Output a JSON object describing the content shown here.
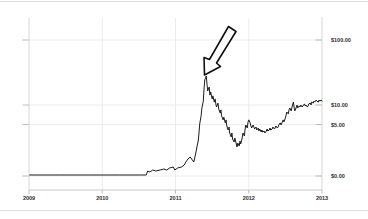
{
  "page": {
    "background": "#ffffff",
    "top_rule_color": "#dedede",
    "bottom_rule_color": "#dedede"
  },
  "chart_data": {
    "type": "line",
    "title": "",
    "xlabel": "",
    "ylabel": "",
    "x_range": [
      2009,
      2013
    ],
    "grid": true,
    "legend": "none",
    "x_ticks": [
      {
        "label": "2009",
        "value": 2009
      },
      {
        "label": "2010",
        "value": 2010
      },
      {
        "label": "2011",
        "value": 2011
      },
      {
        "label": "2012",
        "value": 2012
      },
      {
        "label": "2013",
        "value": 2013
      }
    ],
    "y_ticks": [
      {
        "label": "$100.00",
        "value": 100
      },
      {
        "label": "$10.00",
        "value": 10
      },
      {
        "label": "$5.00",
        "value": 5
      },
      {
        "label": "$0.00",
        "value": 0
      }
    ],
    "colors": {
      "line": "#1c1c1c",
      "grid": "#ececec",
      "axis": "#d6d6d6",
      "axis_bottom": "#c9c9c9",
      "tick": "#bdbdbd",
      "label": "#2b2b2b",
      "annotation_fill": "#ffffff",
      "annotation_stroke": "#111111"
    },
    "series": [
      {
        "name": "price-usd",
        "points": [
          [
            2009.01,
            0.1
          ],
          [
            2009.42,
            0.1
          ],
          [
            2009.83,
            0.1
          ],
          [
            2010.24,
            0.1
          ],
          [
            2010.52,
            0.1
          ],
          [
            2010.6,
            0.1
          ],
          [
            2010.62,
            0.49
          ],
          [
            2010.65,
            0.39
          ],
          [
            2010.69,
            0.58
          ],
          [
            2010.73,
            0.49
          ],
          [
            2010.79,
            0.58
          ],
          [
            2010.84,
            0.68
          ],
          [
            2010.88,
            0.58
          ],
          [
            2010.92,
            0.78
          ],
          [
            2010.97,
            0.87
          ],
          [
            2010.99,
            0.58
          ],
          [
            2011.03,
            0.78
          ],
          [
            2011.08,
            0.87
          ],
          [
            2011.12,
            1.07
          ],
          [
            2011.14,
            1.36
          ],
          [
            2011.17,
            1.65
          ],
          [
            2011.2,
            1.84
          ],
          [
            2011.23,
            1.55
          ],
          [
            2011.25,
            1.36
          ],
          [
            2011.28,
            2.33
          ],
          [
            2011.29,
            2.72
          ],
          [
            2011.31,
            3.4
          ],
          [
            2011.32,
            4.08
          ],
          [
            2011.33,
            5.1
          ],
          [
            2011.35,
            6.8
          ],
          [
            2011.36,
            9.0
          ],
          [
            2011.38,
            11.5
          ],
          [
            2011.39,
            18.3
          ],
          [
            2011.4,
            24.3
          ],
          [
            2011.42,
            27.9
          ],
          [
            2011.43,
            21.0
          ],
          [
            2011.44,
            16.4
          ],
          [
            2011.46,
            18.9
          ],
          [
            2011.47,
            14.2
          ],
          [
            2011.48,
            15.9
          ],
          [
            2011.5,
            12.4
          ],
          [
            2011.51,
            13.8
          ],
          [
            2011.53,
            11.1
          ],
          [
            2011.54,
            12.4
          ],
          [
            2011.55,
            10.4
          ],
          [
            2011.56,
            9.3
          ],
          [
            2011.58,
            10.7
          ],
          [
            2011.59,
            8.7
          ],
          [
            2011.61,
            7.5
          ],
          [
            2011.62,
            8.4
          ],
          [
            2011.63,
            6.8
          ],
          [
            2011.65,
            5.9
          ],
          [
            2011.66,
            6.5
          ],
          [
            2011.68,
            5.3
          ],
          [
            2011.69,
            5.9
          ],
          [
            2011.7,
            4.85
          ],
          [
            2011.72,
            4.47
          ],
          [
            2011.73,
            4.76
          ],
          [
            2011.74,
            4.17
          ],
          [
            2011.76,
            3.79
          ],
          [
            2011.77,
            4.17
          ],
          [
            2011.78,
            3.59
          ],
          [
            2011.8,
            3.3
          ],
          [
            2011.81,
            3.69
          ],
          [
            2011.83,
            3.11
          ],
          [
            2011.84,
            2.82
          ],
          [
            2011.85,
            3.2
          ],
          [
            2011.87,
            2.91
          ],
          [
            2011.88,
            3.4
          ],
          [
            2011.89,
            3.11
          ],
          [
            2011.91,
            3.69
          ],
          [
            2011.92,
            4.17
          ],
          [
            2011.94,
            3.88
          ],
          [
            2011.95,
            4.56
          ],
          [
            2011.96,
            4.95
          ],
          [
            2011.98,
            4.66
          ],
          [
            2011.99,
            5.47
          ],
          [
            2012.0,
            5.9
          ],
          [
            2012.02,
            5.3
          ],
          [
            2012.03,
            4.85
          ],
          [
            2012.04,
            4.66
          ],
          [
            2012.06,
            4.95
          ],
          [
            2012.07,
            4.76
          ],
          [
            2012.08,
            4.56
          ],
          [
            2012.1,
            4.76
          ],
          [
            2012.11,
            4.47
          ],
          [
            2012.13,
            4.66
          ],
          [
            2012.14,
            4.37
          ],
          [
            2012.15,
            4.56
          ],
          [
            2012.17,
            4.27
          ],
          [
            2012.18,
            4.47
          ],
          [
            2012.19,
            4.27
          ],
          [
            2012.21,
            4.37
          ],
          [
            2012.22,
            4.17
          ],
          [
            2012.24,
            4.37
          ],
          [
            2012.25,
            4.56
          ],
          [
            2012.26,
            4.37
          ],
          [
            2012.28,
            4.47
          ],
          [
            2012.29,
            4.66
          ],
          [
            2012.3,
            4.47
          ],
          [
            2012.32,
            4.56
          ],
          [
            2012.33,
            4.76
          ],
          [
            2012.35,
            4.56
          ],
          [
            2012.36,
            4.66
          ],
          [
            2012.37,
            4.85
          ],
          [
            2012.39,
            4.66
          ],
          [
            2012.4,
            4.76
          ],
          [
            2012.41,
            4.95
          ],
          [
            2012.43,
            5.3
          ],
          [
            2012.44,
            4.95
          ],
          [
            2012.46,
            5.5
          ],
          [
            2012.47,
            5.9
          ],
          [
            2012.48,
            5.5
          ],
          [
            2012.5,
            6.3
          ],
          [
            2012.51,
            7.0
          ],
          [
            2012.52,
            7.8
          ],
          [
            2012.54,
            7.3
          ],
          [
            2012.55,
            8.4
          ],
          [
            2012.56,
            9.0
          ],
          [
            2012.58,
            8.1
          ],
          [
            2012.59,
            9.3
          ],
          [
            2012.61,
            11.1
          ],
          [
            2012.62,
            9.0
          ],
          [
            2012.63,
            8.1
          ],
          [
            2012.65,
            9.3
          ],
          [
            2012.66,
            10.0
          ],
          [
            2012.67,
            9.0
          ],
          [
            2012.69,
            9.7
          ],
          [
            2012.7,
            9.3
          ],
          [
            2012.71,
            10.0
          ],
          [
            2012.73,
            9.3
          ],
          [
            2012.74,
            9.7
          ],
          [
            2012.76,
            10.4
          ],
          [
            2012.77,
            9.7
          ],
          [
            2012.78,
            10.0
          ],
          [
            2012.8,
            9.3
          ],
          [
            2012.81,
            9.7
          ],
          [
            2012.82,
            10.4
          ],
          [
            2012.84,
            10.7
          ],
          [
            2012.85,
            10.0
          ],
          [
            2012.86,
            11.1
          ],
          [
            2012.88,
            10.7
          ],
          [
            2012.89,
            11.5
          ],
          [
            2012.9,
            11.1
          ],
          [
            2012.92,
            11.9
          ],
          [
            2012.93,
            11.5
          ],
          [
            2012.95,
            11.1
          ],
          [
            2012.96,
            11.9
          ],
          [
            2012.97,
            11.5
          ],
          [
            2012.99,
            11.9
          ],
          [
            2013.0,
            11.5
          ]
        ]
      }
    ],
    "annotation": {
      "type": "hand-drawn-arrow",
      "points_at": "peak of mid-2011 spike",
      "polygon_px": [
        [
          204.5,
          75
        ],
        [
          204,
          57.5
        ],
        [
          209.5,
          59.5
        ],
        [
          228.5,
          26.5
        ],
        [
          236,
          31.5
        ],
        [
          216.5,
          63
        ],
        [
          220.5,
          66.5
        ]
      ]
    }
  }
}
